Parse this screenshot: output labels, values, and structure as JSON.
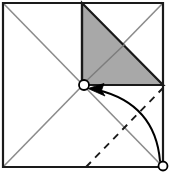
{
  "figure": {
    "title": "Square fold diagram",
    "canvas": {
      "width": 170,
      "height": 175
    },
    "colors": {
      "outline": "#1a1a1a",
      "shade_fill": "#a8a8a8",
      "shade_stroke": "#1a1a1a",
      "crease_gray": "#8c8c8c",
      "fold_dash": "#1a1a1a",
      "arrow": "#000000",
      "marker_fill": "#ffffff",
      "background": "#ffffff"
    },
    "geometry": {
      "square": {
        "top_left": [
          3,
          3
        ],
        "top_right": [
          163,
          3
        ],
        "bottom_right": [
          163,
          167
        ],
        "bottom_left": [
          3,
          167
        ]
      },
      "center_point": [
        84,
        85
      ],
      "main_diagonal": [
        [
          3,
          3
        ],
        [
          163,
          167
        ]
      ],
      "anti_diagonal": [
        [
          3,
          167
        ],
        [
          163,
          3
        ]
      ],
      "shaded_triangle": [
        [
          82,
          3
        ],
        [
          163,
          85
        ],
        [
          82,
          85
        ]
      ],
      "shaded_inner_crease": [
        [
          82,
          85
        ],
        [
          125,
          44
        ]
      ],
      "vertical_crease": [
        [
          82,
          3
        ],
        [
          82,
          85
        ]
      ],
      "horizontal_crease": [
        [
          82,
          85
        ],
        [
          163,
          85
        ]
      ],
      "fold_dash_line": [
        [
          86,
          167
        ],
        [
          163,
          88
        ]
      ],
      "arrow_start": [
        160,
        163
      ],
      "arrow_end": [
        92,
        90
      ],
      "arrow_control": [
        152,
        100
      ]
    },
    "markers": [
      {
        "name": "center-vertex-marker",
        "cx": 84,
        "cy": 85,
        "r": 5
      },
      {
        "name": "corner-vertex-marker",
        "cx": 163,
        "cy": 166,
        "r": 4.5
      }
    ],
    "labels": {
      "center_point": "",
      "corner_point": "",
      "fold_line": "",
      "arrow": ""
    }
  }
}
